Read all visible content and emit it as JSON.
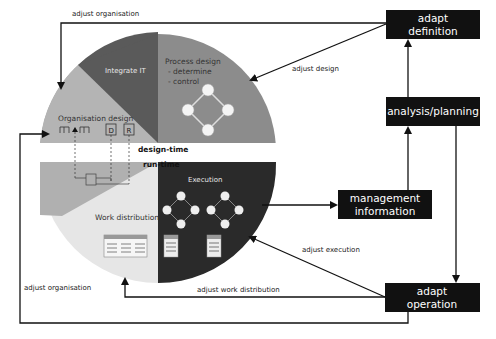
{
  "boxes": {
    "adapt_definition": {
      "line1": "adapt",
      "line2": "definition"
    },
    "analysis_planning": {
      "label": "analysis/planning"
    },
    "management_information": {
      "line1": "management",
      "line2": "information"
    },
    "adapt_operation": {
      "line1": "adapt",
      "line2": "operation"
    }
  },
  "segments": {
    "integrate_it": "Integrate IT",
    "process_design": {
      "title": "Process design",
      "item1": "- determine",
      "item2": "- control"
    },
    "organisation_design": "Organisation design",
    "execution": "Execution",
    "work_distribution": "Work distribution"
  },
  "org_icons": {
    "d_label": "D",
    "r_label": "R"
  },
  "divider": {
    "design_time": "design-time",
    "run_time": "run-time"
  },
  "arrow_labels": {
    "adjust_organisation_top": "adjust organisation",
    "adjust_design": "adjust design",
    "adjust_execution": "adjust execution",
    "adjust_work_distribution": "adjust work distribution",
    "adjust_organisation_bottom": "adjust organisation"
  },
  "colors": {
    "box_fill": "#111111",
    "integrate_it": "#5a5a5a",
    "process_design": "#8c8c8c",
    "organisation_design": "#b4b4b4",
    "execution": "#2a2a2a",
    "work_distribution": "#e6e6e6",
    "lower_left": "#b0b0b0"
  }
}
